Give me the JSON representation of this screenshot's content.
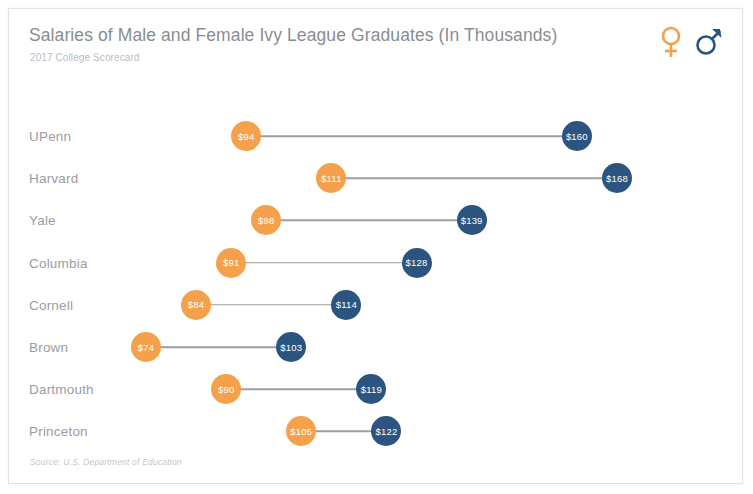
{
  "header": {
    "title": "Salaries of Male and Female Ivy League Graduates (In Thousands)",
    "subtitle": "2017 College Scorecard"
  },
  "legend": {
    "items": [
      {
        "icon": "female-symbol-icon",
        "label": "Female",
        "color": "#f5a04b"
      },
      {
        "icon": "male-symbol-icon",
        "label": "Male",
        "color": "#2b5580"
      }
    ]
  },
  "footer": {
    "source": "Source: U.S. Department of Education"
  },
  "colors": {
    "female": "#f5a04b",
    "male": "#2b5580",
    "connector": "#9b9fa3",
    "label": "#9a9da0",
    "title": "#8a8d90"
  },
  "chart_data": {
    "type": "bar",
    "subtype": "dumbbell",
    "title": "Salaries of Male and Female Ivy League Graduates (In Thousands)",
    "subtitle": "2017 College Scorecard",
    "xlabel": "",
    "ylabel": "",
    "xlim": [
      60,
      180
    ],
    "grid": false,
    "legend_position": "top-right",
    "categories": [
      "UPenn",
      "Harvard",
      "Yale",
      "Columbia",
      "Cornell",
      "Brown",
      "Dartmouth",
      "Princeton"
    ],
    "series": [
      {
        "name": "Female",
        "color": "#f5a04b",
        "values": [
          94,
          111,
          98,
          91,
          84,
          74,
          90,
          105
        ]
      },
      {
        "name": "Male",
        "color": "#2b5580",
        "values": [
          160,
          168,
          139,
          128,
          114,
          103,
          119,
          122
        ]
      }
    ],
    "point_labels": {
      "female": [
        "$94",
        "$111",
        "$98",
        "$91",
        "$84",
        "$74",
        "$90",
        "$105"
      ],
      "male": [
        "$160",
        "$168",
        "$139",
        "$128",
        "$114",
        "$103",
        "$119",
        "$122"
      ]
    }
  }
}
